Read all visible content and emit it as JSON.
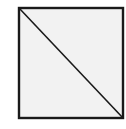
{
  "diagram": {
    "shape": "square-with-diagonal",
    "fill_color": "#f2f2f2",
    "stroke_color": "#1a1a1a",
    "background_color": "#ffffff"
  }
}
